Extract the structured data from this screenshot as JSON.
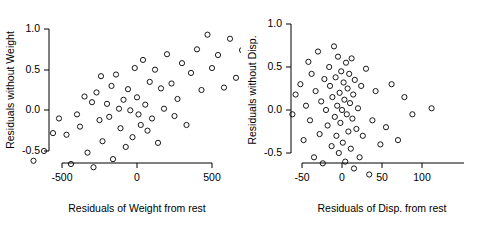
{
  "chart_data": [
    {
      "type": "scatter",
      "title": "",
      "xlabel": "Residuals of Weight from rest",
      "ylabel": "Residuals without Weight",
      "xticks": [
        -500,
        0,
        500
      ],
      "xtick_labels": [
        "-500",
        "0",
        "500"
      ],
      "yticks": [
        -0.5,
        0.0,
        0.5,
        1.0
      ],
      "ytick_labels": [
        "-0.5",
        "0.0",
        "0.5",
        "1.0"
      ],
      "xlim": [
        -780,
        900
      ],
      "ylim": [
        -0.85,
        1.22
      ],
      "grid": false,
      "legend": null,
      "marker": "open-circle",
      "points": [
        [
          -690,
          -0.62
        ],
        [
          -620,
          -0.5
        ],
        [
          -560,
          -0.28
        ],
        [
          -520,
          -0.1
        ],
        [
          -470,
          -0.3
        ],
        [
          -440,
          -0.66
        ],
        [
          -400,
          -0.05
        ],
        [
          -380,
          -0.2
        ],
        [
          -350,
          0.17
        ],
        [
          -330,
          -0.52
        ],
        [
          -300,
          0.1
        ],
        [
          -290,
          -0.7
        ],
        [
          -270,
          0.22
        ],
        [
          -250,
          -0.12
        ],
        [
          -240,
          0.42
        ],
        [
          -230,
          -0.38
        ],
        [
          -200,
          0.08
        ],
        [
          -185,
          -0.08
        ],
        [
          -170,
          0.3
        ],
        [
          -160,
          -0.6
        ],
        [
          -140,
          0.44
        ],
        [
          -120,
          0.02
        ],
        [
          -110,
          -0.22
        ],
        [
          -90,
          0.13
        ],
        [
          -75,
          -0.45
        ],
        [
          -60,
          0.26
        ],
        [
          -45,
          0.0
        ],
        [
          -30,
          -0.33
        ],
        [
          -15,
          0.52
        ],
        [
          0,
          0.16
        ],
        [
          10,
          -0.05
        ],
        [
          25,
          -0.18
        ],
        [
          40,
          0.62
        ],
        [
          55,
          0.07
        ],
        [
          70,
          -0.25
        ],
        [
          85,
          0.35
        ],
        [
          100,
          -0.1
        ],
        [
          120,
          0.5
        ],
        [
          140,
          -0.4
        ],
        [
          160,
          0.27
        ],
        [
          180,
          0.02
        ],
        [
          200,
          0.69
        ],
        [
          230,
          0.33
        ],
        [
          250,
          -0.07
        ],
        [
          270,
          0.14
        ],
        [
          300,
          0.58
        ],
        [
          330,
          -0.18
        ],
        [
          360,
          0.46
        ],
        [
          400,
          0.75
        ],
        [
          430,
          0.25
        ],
        [
          470,
          0.93
        ],
        [
          500,
          0.52
        ],
        [
          540,
          0.68
        ],
        [
          580,
          0.28
        ],
        [
          620,
          0.88
        ],
        [
          660,
          0.4
        ],
        [
          700,
          0.74
        ],
        [
          760,
          0.57
        ],
        [
          830,
          1.1
        ]
      ]
    },
    {
      "type": "scatter",
      "title": "",
      "xlabel": "Residuals of Disp. from rest",
      "ylabel": "Residuals without Disp.",
      "xticks": [
        -50,
        0,
        50,
        100
      ],
      "xtick_labels": [
        "-50",
        "0",
        "50",
        "100"
      ],
      "yticks": [
        -0.5,
        0.0,
        0.5,
        1.0
      ],
      "ytick_labels": [
        "-0.5",
        "0.0",
        "0.5",
        "1.0"
      ],
      "xlim": [
        -78,
        128
      ],
      "ylim": [
        -0.85,
        1.05
      ],
      "grid": false,
      "legend": null,
      "marker": "open-circle",
      "points": [
        [
          -62,
          -0.05
        ],
        [
          -58,
          0.18
        ],
        [
          -52,
          0.3
        ],
        [
          -48,
          -0.35
        ],
        [
          -45,
          0.05
        ],
        [
          -42,
          0.56
        ],
        [
          -40,
          -0.12
        ],
        [
          -38,
          0.42
        ],
        [
          -35,
          -0.55
        ],
        [
          -33,
          0.22
        ],
        [
          -30,
          0.68
        ],
        [
          -28,
          -0.28
        ],
        [
          -26,
          0.1
        ],
        [
          -24,
          -0.62
        ],
        [
          -22,
          0.36
        ],
        [
          -20,
          0.0
        ],
        [
          -18,
          -0.18
        ],
        [
          -16,
          0.5
        ],
        [
          -15,
          0.28
        ],
        [
          -13,
          -0.42
        ],
        [
          -12,
          0.15
        ],
        [
          -10,
          0.74
        ],
        [
          -9,
          -0.08
        ],
        [
          -8,
          0.38
        ],
        [
          -7,
          -0.3
        ],
        [
          -6,
          0.05
        ],
        [
          -5,
          0.62
        ],
        [
          -4,
          -0.5
        ],
        [
          -3,
          0.2
        ],
        [
          -2,
          -0.15
        ],
        [
          -1,
          0.45
        ],
        [
          0,
          0.0
        ],
        [
          1,
          -0.38
        ],
        [
          2,
          0.32
        ],
        [
          3,
          0.12
        ],
        [
          4,
          -0.6
        ],
        [
          5,
          0.55
        ],
        [
          6,
          -0.05
        ],
        [
          7,
          0.25
        ],
        [
          8,
          -0.25
        ],
        [
          9,
          0.42
        ],
        [
          10,
          0.08
        ],
        [
          11,
          -0.45
        ],
        [
          12,
          0.6
        ],
        [
          13,
          -0.1
        ],
        [
          14,
          0.18
        ],
        [
          15,
          -0.68
        ],
        [
          16,
          0.35
        ],
        [
          18,
          -0.22
        ],
        [
          20,
          0.02
        ],
        [
          22,
          -0.55
        ],
        [
          24,
          0.28
        ],
        [
          26,
          -0.3
        ],
        [
          30,
          0.48
        ],
        [
          34,
          -0.75
        ],
        [
          38,
          -0.12
        ],
        [
          42,
          0.22
        ],
        [
          48,
          -0.4
        ],
        [
          55,
          -0.2
        ],
        [
          62,
          0.3
        ],
        [
          70,
          -0.35
        ],
        [
          78,
          0.15
        ],
        [
          88,
          -0.05
        ],
        [
          112,
          0.02
        ]
      ]
    }
  ]
}
